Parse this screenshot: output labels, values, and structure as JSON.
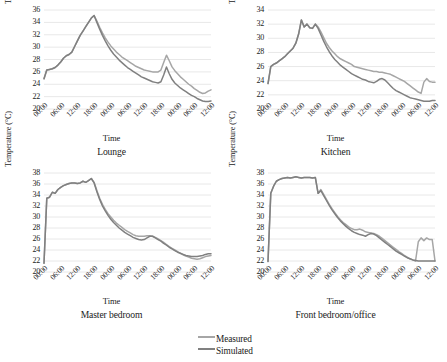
{
  "figure": {
    "panel_count": 4,
    "colors": {
      "measured": "#a6a6a6",
      "simulated": "#808080",
      "gridline": "#e8e8e8",
      "text": "#1a1a1a"
    }
  },
  "legend": {
    "position": "bottom-center-right",
    "entries": [
      {
        "label": "Measured",
        "color": "#a6a6a6"
      },
      {
        "label": "Simulated",
        "color": "#808080"
      }
    ]
  },
  "chart_data": [
    {
      "type": "line",
      "title": "Lounge",
      "xlabel": "Time",
      "ylabel": "Temperature (°C)",
      "ylim": [
        20,
        36
      ],
      "yticks": [
        20,
        22,
        24,
        26,
        28,
        30,
        32,
        34,
        36
      ],
      "xticks": [
        "00:00",
        "06:00",
        "12:00",
        "18:00",
        "00:00",
        "06:00",
        "12:00",
        "18:00",
        "00:00",
        "06:00",
        "12:00"
      ],
      "grid": true,
      "legend_shared": true,
      "x": [
        0,
        1,
        2,
        3,
        4,
        5,
        6,
        7,
        8,
        9,
        10,
        11,
        12,
        13,
        14,
        15,
        16,
        17,
        18,
        19,
        20,
        21,
        22,
        23,
        24,
        25,
        26,
        27,
        28,
        29,
        30,
        31,
        32,
        33,
        34,
        35,
        36,
        37,
        38,
        39,
        40,
        41,
        42,
        43,
        44,
        45,
        46,
        47,
        48,
        49,
        50,
        51,
        52,
        53,
        54,
        55,
        56,
        57,
        58,
        59,
        60
      ],
      "series": [
        {
          "name": "Measured",
          "color": "#a6a6a6",
          "values": [
            24.9,
            26.3,
            26.4,
            26.5,
            26.7,
            27.1,
            27.6,
            28.2,
            28.6,
            28.8,
            29.2,
            30.1,
            31.0,
            31.9,
            32.6,
            33.3,
            34.0,
            34.7,
            35.1,
            34.2,
            33.2,
            32.3,
            31.5,
            30.8,
            30.2,
            29.7,
            29.2,
            28.8,
            28.4,
            28.1,
            27.8,
            27.5,
            27.2,
            26.9,
            26.7,
            26.5,
            26.3,
            26.2,
            26.1,
            26.0,
            26.0,
            26.0,
            26.3,
            27.5,
            28.7,
            27.8,
            26.8,
            26.2,
            25.7,
            25.2,
            24.8,
            24.4,
            24.0,
            23.7,
            23.3,
            23.0,
            22.7,
            22.5,
            22.6,
            22.9,
            23.1
          ]
        },
        {
          "name": "Simulated",
          "color": "#808080",
          "values": [
            24.9,
            26.3,
            26.4,
            26.5,
            26.7,
            27.1,
            27.6,
            28.2,
            28.6,
            28.8,
            29.2,
            30.1,
            31.0,
            31.9,
            32.6,
            33.3,
            34.0,
            34.7,
            35.1,
            34.0,
            32.9,
            31.9,
            31.0,
            30.2,
            29.5,
            28.9,
            28.4,
            27.9,
            27.5,
            27.1,
            26.7,
            26.4,
            26.1,
            25.8,
            25.5,
            25.2,
            25.0,
            24.8,
            24.6,
            24.4,
            24.3,
            24.2,
            24.4,
            25.5,
            26.8,
            25.7,
            24.8,
            24.2,
            23.8,
            23.4,
            23.1,
            22.8,
            22.5,
            22.2,
            22.0,
            21.7,
            21.5,
            21.3,
            21.2,
            21.2,
            21.3
          ]
        }
      ]
    },
    {
      "type": "line",
      "title": "Kitchen",
      "xlabel": "Time",
      "ylabel": "Temperature (°C)",
      "ylim": [
        20,
        34
      ],
      "yticks": [
        20,
        22,
        24,
        26,
        28,
        30,
        32,
        34
      ],
      "xticks": [
        "00:00",
        "06:00",
        "12:00",
        "18:00",
        "00:00",
        "06:00",
        "12:00",
        "18:00",
        "00:00",
        "06:00",
        "12:00"
      ],
      "grid": true,
      "legend_shared": true,
      "x": [
        0,
        1,
        2,
        3,
        4,
        5,
        6,
        7,
        8,
        9,
        10,
        11,
        12,
        13,
        14,
        15,
        16,
        17,
        18,
        19,
        20,
        21,
        22,
        23,
        24,
        25,
        26,
        27,
        28,
        29,
        30,
        31,
        32,
        33,
        34,
        35,
        36,
        37,
        38,
        39,
        40,
        41,
        42,
        43,
        44,
        45,
        46,
        47,
        48,
        49,
        50,
        51,
        52,
        53,
        54,
        55,
        56,
        57,
        58,
        59,
        60
      ],
      "series": [
        {
          "name": "Measured",
          "color": "#a6a6a6",
          "values": [
            23.6,
            26.0,
            26.3,
            26.5,
            26.8,
            27.1,
            27.4,
            27.8,
            28.2,
            28.6,
            29.3,
            30.6,
            32.6,
            31.6,
            32.0,
            31.5,
            31.4,
            32.0,
            31.6,
            30.9,
            30.1,
            29.3,
            28.7,
            28.2,
            27.8,
            27.4,
            27.1,
            26.9,
            26.7,
            26.5,
            26.3,
            26.0,
            25.9,
            25.8,
            25.7,
            25.6,
            25.5,
            25.4,
            25.3,
            25.3,
            25.2,
            25.2,
            25.1,
            25.0,
            24.9,
            24.7,
            24.5,
            24.3,
            24.1,
            23.9,
            23.6,
            23.3,
            23.0,
            22.7,
            22.4,
            22.2,
            23.8,
            24.3,
            23.9,
            23.8,
            23.8
          ]
        },
        {
          "name": "Simulated",
          "color": "#808080",
          "values": [
            23.6,
            26.0,
            26.3,
            26.5,
            26.8,
            27.1,
            27.4,
            27.8,
            28.2,
            28.6,
            29.3,
            30.6,
            32.6,
            31.6,
            32.0,
            31.5,
            31.4,
            32.0,
            31.4,
            30.5,
            29.6,
            28.8,
            28.1,
            27.5,
            27.0,
            26.6,
            26.2,
            25.9,
            25.6,
            25.3,
            25.0,
            24.8,
            24.6,
            24.4,
            24.2,
            24.1,
            23.9,
            23.8,
            23.7,
            23.9,
            24.2,
            24.3,
            24.1,
            23.7,
            23.3,
            22.9,
            22.6,
            22.4,
            22.2,
            22.0,
            21.8,
            21.6,
            21.5,
            21.4,
            21.3,
            21.2,
            21.1,
            21.1,
            21.1,
            21.2,
            21.2
          ]
        }
      ]
    },
    {
      "type": "line",
      "title": "Master bedroom",
      "xlabel": "Time",
      "ylabel": "Temperature (°C)",
      "ylim": [
        20,
        38
      ],
      "yticks": [
        20,
        22,
        24,
        26,
        28,
        30,
        32,
        34,
        36,
        38
      ],
      "xticks": [
        "00:00",
        "06:00",
        "12:00",
        "18:00",
        "00:00",
        "06:00",
        "12:00",
        "18:00",
        "00:00",
        "06:00",
        "12:00"
      ],
      "grid": true,
      "legend_shared": true,
      "x": [
        0,
        1,
        2,
        3,
        4,
        5,
        6,
        7,
        8,
        9,
        10,
        11,
        12,
        13,
        14,
        15,
        16,
        17,
        18,
        19,
        20,
        21,
        22,
        23,
        24,
        25,
        26,
        27,
        28,
        29,
        30,
        31,
        32,
        33,
        34,
        35,
        36,
        37,
        38,
        39,
        40,
        41,
        42,
        43,
        44,
        45,
        46,
        47,
        48,
        49,
        50,
        51,
        52,
        53,
        54,
        55,
        56,
        57,
        58,
        59,
        60
      ],
      "series": [
        {
          "name": "Measured",
          "color": "#a6a6a6",
          "values": [
            21.6,
            33.4,
            33.6,
            34.5,
            34.3,
            35.0,
            35.4,
            35.7,
            35.9,
            36.1,
            36.2,
            36.2,
            36.1,
            36.2,
            36.5,
            36.3,
            36.6,
            37.0,
            36.3,
            34.8,
            33.4,
            32.3,
            31.4,
            30.6,
            30.0,
            29.4,
            28.9,
            28.5,
            28.1,
            27.7,
            27.4,
            27.1,
            26.8,
            26.6,
            26.5,
            26.5,
            26.5,
            26.6,
            26.6,
            26.5,
            26.3,
            26.0,
            25.7,
            25.4,
            25.0,
            24.6,
            24.3,
            24.0,
            23.7,
            23.4,
            23.1,
            22.9,
            22.7,
            22.5,
            22.4,
            22.3,
            22.4,
            22.6,
            22.8,
            22.9,
            23.0
          ]
        },
        {
          "name": "Simulated",
          "color": "#808080",
          "values": [
            21.6,
            33.4,
            33.6,
            34.5,
            34.3,
            35.0,
            35.4,
            35.7,
            35.9,
            36.1,
            36.2,
            36.2,
            36.1,
            36.2,
            36.5,
            36.3,
            36.6,
            37.0,
            36.2,
            34.6,
            33.2,
            32.0,
            31.1,
            30.3,
            29.6,
            29.0,
            28.5,
            28.0,
            27.6,
            27.2,
            26.9,
            26.6,
            26.3,
            26.1,
            25.9,
            25.8,
            25.9,
            26.2,
            26.5,
            26.5,
            26.2,
            25.9,
            25.6,
            25.2,
            24.9,
            24.5,
            24.2,
            23.9,
            23.6,
            23.4,
            23.2,
            23.0,
            22.9,
            22.8,
            22.8,
            22.8,
            22.9,
            23.0,
            23.2,
            23.3,
            23.3
          ]
        }
      ]
    },
    {
      "type": "line",
      "title": "Front bedroom/office",
      "xlabel": "Time",
      "ylabel": "Temperature (°C)",
      "ylim": [
        20,
        38
      ],
      "yticks": [
        20,
        22,
        24,
        26,
        28,
        30,
        32,
        34,
        36,
        38
      ],
      "xticks": [
        "00:00",
        "06:00",
        "12:00",
        "18:00",
        "00:00",
        "06:00",
        "12:00",
        "18:00",
        "00:00",
        "06:00",
        "12:00"
      ],
      "grid": true,
      "legend_shared": true,
      "x": [
        0,
        1,
        2,
        3,
        4,
        5,
        6,
        7,
        8,
        9,
        10,
        11,
        12,
        13,
        14,
        15,
        16,
        17,
        18,
        19,
        20,
        21,
        22,
        23,
        24,
        25,
        26,
        27,
        28,
        29,
        30,
        31,
        32,
        33,
        34,
        35,
        36,
        37,
        38,
        39,
        40,
        41,
        42,
        43,
        44,
        45,
        46,
        47,
        48,
        49,
        50,
        51,
        52,
        53,
        54,
        55,
        56,
        57,
        58,
        59,
        60
      ],
      "series": [
        {
          "name": "Measured",
          "color": "#a6a6a6",
          "values": [
            21.9,
            34.3,
            35.6,
            36.5,
            36.8,
            37.0,
            37.1,
            37.2,
            37.1,
            37.2,
            37.3,
            37.2,
            37.1,
            37.2,
            37.2,
            37.2,
            37.1,
            37.2,
            34.3,
            35.0,
            34.1,
            33.2,
            32.3,
            31.5,
            30.8,
            30.1,
            29.5,
            29.0,
            28.6,
            28.2,
            27.9,
            27.7,
            27.7,
            27.8,
            27.6,
            27.3,
            27.2,
            27.1,
            27.0,
            26.8,
            26.5,
            26.1,
            25.7,
            25.3,
            24.9,
            24.5,
            24.1,
            23.7,
            23.4,
            23.0,
            22.7,
            22.4,
            22.2,
            22.0,
            25.5,
            26.2,
            25.7,
            26.2,
            25.9,
            25.9,
            22.0
          ]
        },
        {
          "name": "Simulated",
          "color": "#808080",
          "values": [
            21.9,
            34.3,
            35.6,
            36.5,
            36.8,
            37.0,
            37.1,
            37.2,
            37.1,
            37.2,
            37.3,
            37.2,
            37.1,
            37.2,
            37.2,
            37.2,
            37.1,
            37.2,
            34.3,
            34.8,
            33.9,
            33.0,
            32.1,
            31.3,
            30.6,
            29.9,
            29.3,
            28.8,
            28.3,
            27.9,
            27.5,
            27.2,
            27.0,
            26.8,
            26.7,
            26.5,
            26.8,
            27.0,
            26.9,
            26.6,
            26.2,
            25.8,
            25.4,
            25.0,
            24.6,
            24.2,
            23.8,
            23.5,
            23.2,
            22.9,
            22.6,
            22.4,
            22.2,
            22.1,
            22.0,
            22.0,
            22.0,
            22.0,
            22.0,
            22.0,
            22.0
          ]
        }
      ]
    }
  ]
}
